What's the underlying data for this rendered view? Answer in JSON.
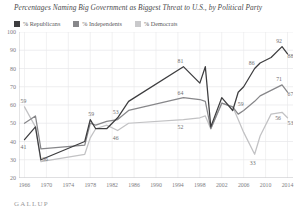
{
  "title": "Percentages Naming Big Government as Biggest Threat to U.S., by Political Party",
  "source_logo": "GALLUP",
  "legend": [
    {
      "label": "% Republicans",
      "color": "#3d3d3f"
    },
    {
      "label": "% Independents",
      "color": "#87878a"
    },
    {
      "label": "% Democrats",
      "color": "#c2c2c4"
    }
  ],
  "chart_data": {
    "type": "line",
    "title": "Percentages Naming Big Government as Biggest Threat to U.S., by Political Party",
    "xlabel": "",
    "ylabel": "",
    "ylim": [
      20,
      100
    ],
    "ytick_values": [
      100,
      90,
      80,
      70,
      60,
      50,
      40,
      30,
      20
    ],
    "ytick_labels": [
      "100",
      "90",
      "80",
      "70",
      "60",
      "50",
      "40",
      "30",
      "20"
    ],
    "xlim": [
      1965,
      2015
    ],
    "xtick_values": [
      1966,
      1970,
      1974,
      1978,
      1982,
      1986,
      1990,
      1994,
      1998,
      2002,
      2006,
      2010,
      2014
    ],
    "xtick_labels": [
      "1966",
      "1970",
      "1974",
      "1978",
      "1982",
      "1986",
      "1990",
      "1994",
      "1998",
      "2002",
      "2006",
      "2010",
      "2014"
    ],
    "grid": true,
    "legend_position": "top-left",
    "x": [
      1966,
      1968,
      1969,
      1977,
      1978,
      1979,
      1981,
      1983,
      1985,
      1995,
      1998,
      1999,
      2000,
      2002,
      2004,
      2005,
      2006,
      2008,
      2009,
      2011,
      2013,
      2014
    ],
    "series": [
      {
        "name": "% Republicans",
        "color": "#3d3d3f",
        "values": [
          41,
          48,
          30,
          40,
          52,
          47,
          47,
          53,
          62,
          81,
          72,
          81,
          48,
          64,
          57,
          67,
          70,
          80,
          83,
          86,
          92,
          88
        ]
      },
      {
        "name": "% Independents",
        "color": "#87878a",
        "values": [
          50,
          54,
          36,
          38,
          50,
          49,
          51,
          52,
          57,
          64,
          63,
          62,
          47,
          61,
          59,
          55,
          57,
          62,
          65,
          68,
          71,
          67
        ]
      },
      {
        "name": "% Democrats",
        "color": "#c2c2c4",
        "values": [
          59,
          48,
          29,
          33,
          42,
          47,
          49,
          46,
          50,
          52,
          53,
          54,
          47,
          61,
          59,
          52,
          45,
          33,
          43,
          55,
          56,
          53
        ]
      }
    ],
    "point_labels": [
      {
        "value": 59,
        "series": "% Democrats"
      },
      {
        "value": 41,
        "series": "% Republicans"
      },
      {
        "value": 36,
        "series": "% Independents"
      },
      {
        "value": 59,
        "series": "% Independents"
      },
      {
        "value": 53,
        "series": "% Republicans"
      },
      {
        "value": 46,
        "series": "% Democrats"
      },
      {
        "value": 81,
        "series": "% Republicans"
      },
      {
        "value": 64,
        "series": "% Independents"
      },
      {
        "value": 52,
        "series": "% Democrats"
      },
      {
        "value": 86,
        "series": "% Republicans"
      },
      {
        "value": 92,
        "series": "% Republicans"
      },
      {
        "value": 88,
        "series": "% Republicans"
      },
      {
        "value": 71,
        "series": "% Independents"
      },
      {
        "value": 67,
        "series": "% Independents"
      },
      {
        "value": 59,
        "series": "% Independents"
      },
      {
        "value": 56,
        "series": "% Democrats"
      },
      {
        "value": 53,
        "series": "% Democrats"
      },
      {
        "value": 33,
        "series": "% Democrats"
      }
    ]
  }
}
